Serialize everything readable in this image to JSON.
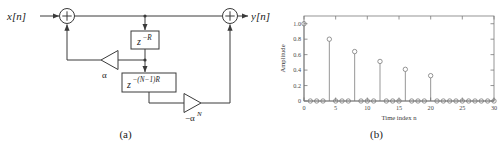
{
  "figure": {
    "panels": [
      {
        "id": "a",
        "caption": "(a)",
        "type": "block-diagram",
        "title": "Comb filter structure",
        "signals": {
          "input_label": "x[n]",
          "output_label": "y[n]"
        },
        "blocks": [
          {
            "name": "delay-R",
            "label": "z",
            "exponent": "−R"
          },
          {
            "name": "delay-N-1-R",
            "label": "z",
            "exponent": "−(N−1)R"
          }
        ],
        "gains": [
          {
            "name": "gain-alpha",
            "label": "α",
            "direction": "left"
          },
          {
            "name": "gain-neg-alpha-N",
            "label": "−α",
            "exponent": "N",
            "direction": "right"
          }
        ],
        "adders": [
          {
            "name": "adder-input",
            "symbol": "+"
          },
          {
            "name": "adder-output",
            "symbol": "+"
          }
        ]
      },
      {
        "id": "b",
        "caption": "(b)",
        "type": "stem-plot"
      }
    ]
  },
  "chart_data": {
    "type": "scatter",
    "plot_style": "stem",
    "title": "",
    "xlabel": "Time index n",
    "ylabel": "Amplitude",
    "xlim": [
      0,
      30
    ],
    "ylim": [
      0,
      1.1
    ],
    "xticks": [
      0,
      5,
      10,
      15,
      20,
      25,
      30
    ],
    "xticklabels": [
      "0",
      "5",
      "10",
      "15",
      "20",
      "25",
      "30"
    ],
    "yticks": [
      0,
      0.2,
      0.4,
      0.6,
      0.8,
      1.0
    ],
    "yticklabels": [
      "0",
      "0.2",
      "0.4",
      "0.6",
      "0.8",
      "1.0"
    ],
    "grid": false,
    "legend": null,
    "marker": "circle-open",
    "x": [
      0,
      1,
      2,
      3,
      4,
      5,
      6,
      7,
      8,
      9,
      10,
      11,
      12,
      13,
      14,
      15,
      16,
      17,
      18,
      19,
      20,
      21,
      22,
      23,
      24,
      25,
      26,
      27,
      28,
      29,
      30
    ],
    "values": [
      1.0,
      0,
      0,
      0,
      0.8,
      0,
      0,
      0,
      0.64,
      0,
      0,
      0,
      0.512,
      0,
      0,
      0,
      0.41,
      0,
      0,
      0,
      0.328,
      0,
      0,
      0,
      0,
      0,
      0,
      0,
      0,
      0,
      0
    ],
    "nonzero_points": [
      {
        "n": 0,
        "amplitude": 1.0
      },
      {
        "n": 4,
        "amplitude": 0.8
      },
      {
        "n": 8,
        "amplitude": 0.64
      },
      {
        "n": 12,
        "amplitude": 0.512
      },
      {
        "n": 16,
        "amplitude": 0.41
      },
      {
        "n": 20,
        "amplitude": 0.328
      }
    ]
  }
}
